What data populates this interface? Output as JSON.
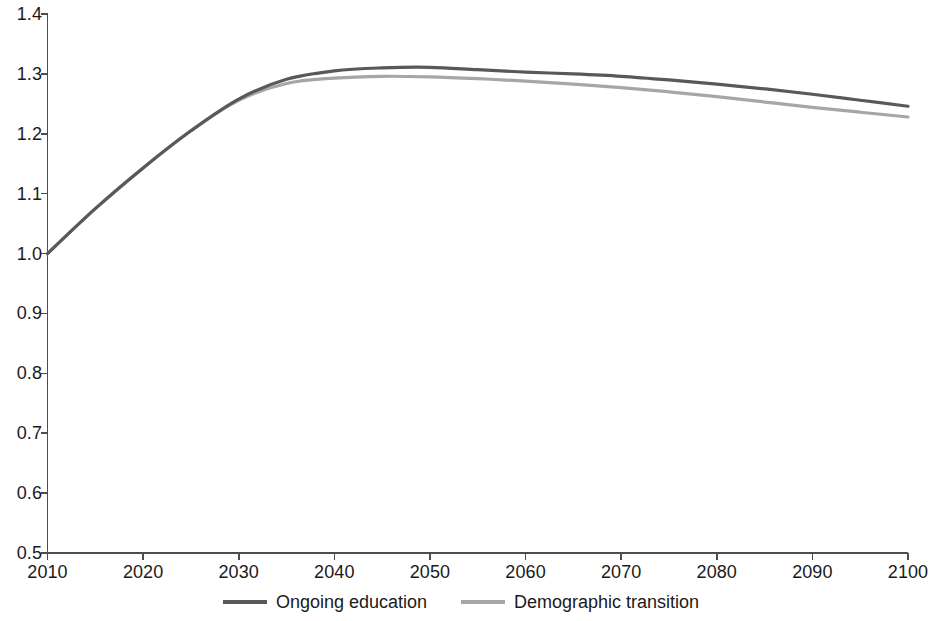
{
  "chart_data": {
    "type": "line",
    "title": "",
    "subtitle": "",
    "xlabel": "",
    "ylabel": "",
    "xlim": [
      2010,
      2100
    ],
    "ylim": [
      0.5,
      1.4
    ],
    "grid": false,
    "legend_position": "bottom",
    "x_tick_labels": [
      "2010",
      "2020",
      "2030",
      "2040",
      "2050",
      "2060",
      "2070",
      "2080",
      "2090",
      "2100"
    ],
    "y_tick_labels": [
      "0.5",
      "0.6",
      "0.7",
      "0.8",
      "0.9",
      "1.0",
      "1.1",
      "1.2",
      "1.3",
      "1.4"
    ],
    "x_ticks": [
      2010,
      2020,
      2030,
      2040,
      2050,
      2060,
      2070,
      2080,
      2090,
      2100
    ],
    "y_ticks": [
      0.5,
      0.6,
      0.7,
      0.8,
      0.9,
      1.0,
      1.1,
      1.2,
      1.3,
      1.4
    ],
    "x": [
      2010,
      2015,
      2020,
      2025,
      2030,
      2035,
      2040,
      2045,
      2050,
      2055,
      2060,
      2065,
      2070,
      2075,
      2080,
      2085,
      2090,
      2095,
      2100
    ],
    "series": [
      {
        "name": "Ongoing education",
        "color": "#595959",
        "values": [
          1.0,
          1.075,
          1.143,
          1.205,
          1.258,
          1.291,
          1.305,
          1.31,
          1.311,
          1.307,
          1.303,
          1.3,
          1.296,
          1.29,
          1.283,
          1.275,
          1.266,
          1.256,
          1.246
        ]
      },
      {
        "name": "Demographic transition",
        "color": "#a6a6a6",
        "values": [
          1.0,
          1.075,
          1.143,
          1.205,
          1.256,
          1.284,
          1.293,
          1.296,
          1.295,
          1.292,
          1.288,
          1.283,
          1.277,
          1.27,
          1.262,
          1.253,
          1.244,
          1.236,
          1.228
        ]
      }
    ]
  },
  "axes": {
    "axis_color": "#4d4d4d"
  },
  "legend": {
    "items": [
      {
        "label": "Ongoing education",
        "color": "#595959"
      },
      {
        "label": "Demographic transition",
        "color": "#a6a6a6"
      }
    ]
  }
}
